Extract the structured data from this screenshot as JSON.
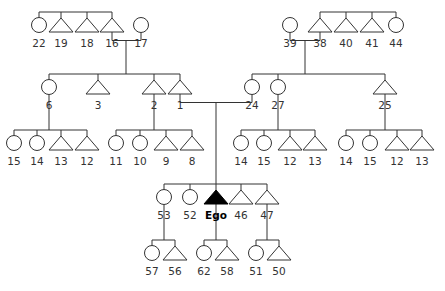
{
  "diagram": {
    "type": "kinship-chart",
    "ego_label": "Ego",
    "colors": {
      "line": "#333333",
      "ego_fill": "#000000",
      "background": "#ffffff"
    },
    "individuals": [
      {
        "id": "22",
        "label": "22",
        "sex": "female"
      },
      {
        "id": "19",
        "label": "19",
        "sex": "male"
      },
      {
        "id": "18",
        "label": "18",
        "sex": "male"
      },
      {
        "id": "16",
        "label": "16",
        "sex": "male"
      },
      {
        "id": "17",
        "label": "17",
        "sex": "female"
      },
      {
        "id": "39",
        "label": "39",
        "sex": "female"
      },
      {
        "id": "38",
        "label": "38",
        "sex": "male"
      },
      {
        "id": "40",
        "label": "40",
        "sex": "male"
      },
      {
        "id": "41",
        "label": "41",
        "sex": "male"
      },
      {
        "id": "44",
        "label": "44",
        "sex": "female"
      },
      {
        "id": "6",
        "label": "6",
        "sex": "female"
      },
      {
        "id": "3",
        "label": "3",
        "sex": "male"
      },
      {
        "id": "2",
        "label": "2",
        "sex": "male"
      },
      {
        "id": "1",
        "label": "1",
        "sex": "male"
      },
      {
        "id": "24",
        "label": "24",
        "sex": "female"
      },
      {
        "id": "27",
        "label": "27",
        "sex": "female"
      },
      {
        "id": "25",
        "label": "25",
        "sex": "male"
      },
      {
        "id": "6-c1",
        "label": "15",
        "sex": "female"
      },
      {
        "id": "6-c2",
        "label": "14",
        "sex": "female"
      },
      {
        "id": "6-c3",
        "label": "13",
        "sex": "male"
      },
      {
        "id": "6-c4",
        "label": "12",
        "sex": "male"
      },
      {
        "id": "2-c1",
        "label": "11",
        "sex": "female"
      },
      {
        "id": "2-c2",
        "label": "10",
        "sex": "female"
      },
      {
        "id": "2-c3",
        "label": "9",
        "sex": "male"
      },
      {
        "id": "2-c4",
        "label": "8",
        "sex": "male"
      },
      {
        "id": "27-c1",
        "label": "14",
        "sex": "female"
      },
      {
        "id": "27-c2",
        "label": "15",
        "sex": "female"
      },
      {
        "id": "27-c3",
        "label": "12",
        "sex": "male"
      },
      {
        "id": "27-c4",
        "label": "13",
        "sex": "male"
      },
      {
        "id": "25-c1",
        "label": "14",
        "sex": "female"
      },
      {
        "id": "25-c2",
        "label": "15",
        "sex": "female"
      },
      {
        "id": "25-c3",
        "label": "12",
        "sex": "male"
      },
      {
        "id": "25-c4",
        "label": "13",
        "sex": "male"
      },
      {
        "id": "53",
        "label": "53",
        "sex": "female"
      },
      {
        "id": "52",
        "label": "52",
        "sex": "female"
      },
      {
        "id": "ego",
        "label": "Ego",
        "sex": "male",
        "is_ego": true
      },
      {
        "id": "46",
        "label": "46",
        "sex": "male"
      },
      {
        "id": "47",
        "label": "47",
        "sex": "male"
      },
      {
        "id": "57",
        "label": "57",
        "sex": "female"
      },
      {
        "id": "56",
        "label": "56",
        "sex": "male"
      },
      {
        "id": "62",
        "label": "62",
        "sex": "female"
      },
      {
        "id": "58",
        "label": "58",
        "sex": "male"
      },
      {
        "id": "51",
        "label": "51",
        "sex": "female"
      },
      {
        "id": "50",
        "label": "50",
        "sex": "male"
      }
    ],
    "sibling_groups": [
      {
        "members": [
          "22",
          "19",
          "18",
          "16"
        ]
      },
      {
        "members": [
          "38",
          "40",
          "41",
          "44"
        ]
      },
      {
        "members": [
          "6",
          "3",
          "2",
          "1"
        ],
        "parents": [
          "16",
          "17"
        ]
      },
      {
        "members": [
          "24",
          "27",
          "25"
        ],
        "parents": [
          "39",
          "38"
        ]
      },
      {
        "members": [
          "6-c1",
          "6-c2",
          "6-c3",
          "6-c4"
        ],
        "parents": [
          "6"
        ]
      },
      {
        "members": [
          "2-c1",
          "2-c2",
          "2-c3",
          "2-c4"
        ],
        "parents": [
          "2"
        ]
      },
      {
        "members": [
          "27-c1",
          "27-c2",
          "27-c3",
          "27-c4"
        ],
        "parents": [
          "27"
        ]
      },
      {
        "members": [
          "25-c1",
          "25-c2",
          "25-c3",
          "25-c4"
        ],
        "parents": [
          "25"
        ]
      },
      {
        "members": [
          "53",
          "52",
          "ego",
          "46",
          "47"
        ],
        "parents": [
          "1",
          "24"
        ]
      },
      {
        "members": [
          "57",
          "56"
        ],
        "parents": [
          "53"
        ]
      },
      {
        "members": [
          "62",
          "58"
        ],
        "parents": [
          "ego"
        ]
      },
      {
        "members": [
          "51",
          "50"
        ],
        "parents": [
          "47"
        ]
      }
    ],
    "marriages": [
      {
        "spouses": [
          "16",
          "17"
        ]
      },
      {
        "spouses": [
          "39",
          "38"
        ]
      },
      {
        "spouses": [
          "1",
          "24"
        ]
      }
    ]
  }
}
